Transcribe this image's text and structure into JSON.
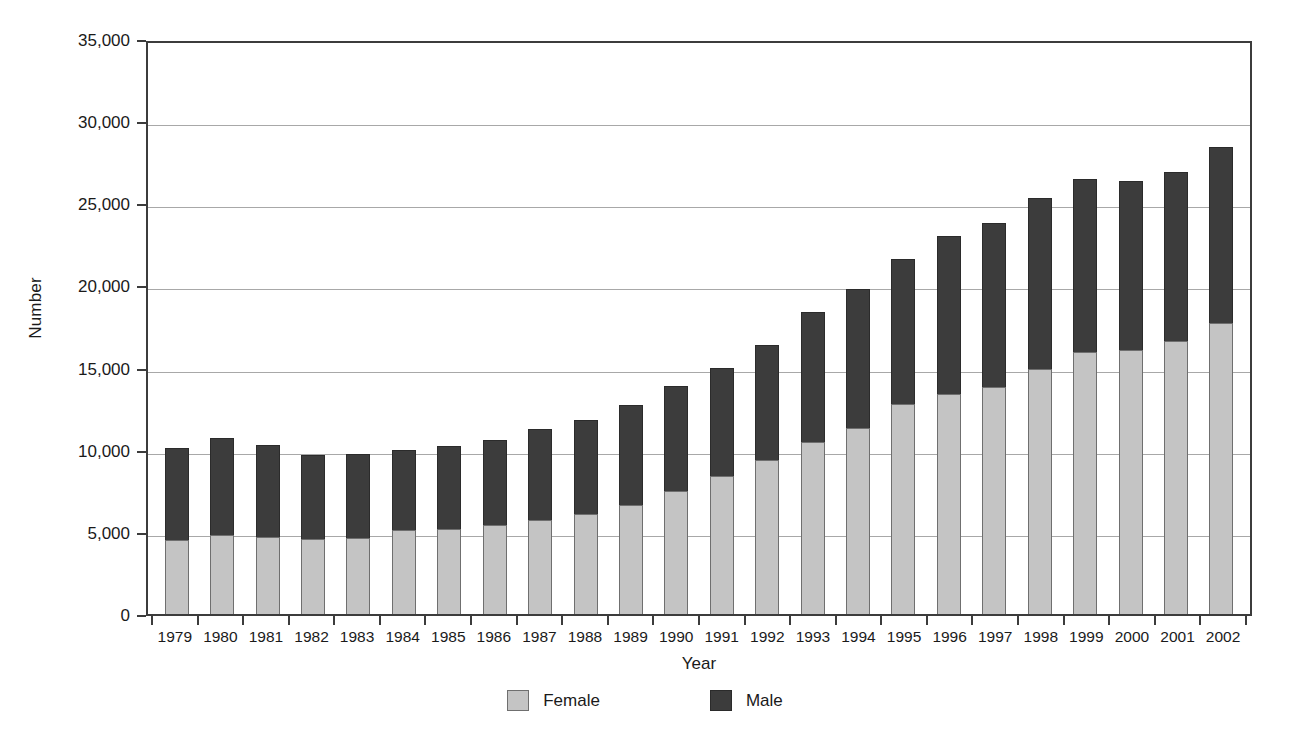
{
  "chart_data": {
    "type": "bar",
    "subtype": "stacked-vertical",
    "title": "",
    "xlabel": "Year",
    "ylabel": "Number",
    "ylim": [
      0,
      35000
    ],
    "ytick_step": 5000,
    "ytick_labels": [
      "0",
      "5,000",
      "10,000",
      "15,000",
      "20,000",
      "25,000",
      "30,000",
      "35,000"
    ],
    "ytick_values": [
      0,
      5000,
      10000,
      15000,
      20000,
      25000,
      30000,
      35000
    ],
    "grid": true,
    "grid_axis": "y",
    "legend_position": "bottom-center",
    "categories": [
      "1979",
      "1980",
      "1981",
      "1982",
      "1983",
      "1984",
      "1985",
      "1986",
      "1987",
      "1988",
      "1989",
      "1990",
      "1991",
      "1992",
      "1993",
      "1994",
      "1995",
      "1996",
      "1997",
      "1998",
      "1999",
      "2000",
      "2001",
      "2002"
    ],
    "series": [
      {
        "name": "Female",
        "color": "#c4c4c4",
        "values": [
          4500,
          4800,
          4700,
          4550,
          4650,
          5100,
          5200,
          5400,
          5700,
          6100,
          6650,
          7500,
          8400,
          9350,
          10500,
          11350,
          12800,
          13400,
          13800,
          14900,
          15950,
          16100,
          16600,
          17700
        ]
      },
      {
        "name": "Male",
        "color": "#3c3c3c",
        "values": [
          5600,
          5900,
          5600,
          5100,
          5100,
          4900,
          5000,
          5200,
          5550,
          5700,
          6050,
          6350,
          6600,
          7050,
          7900,
          8450,
          8800,
          9600,
          10000,
          10400,
          10550,
          10250,
          10300,
          10700
        ]
      }
    ],
    "totals": [
      10100,
      10700,
      10300,
      9650,
      9750,
      10000,
      10200,
      10600,
      11250,
      11800,
      12700,
      13850,
      15000,
      16400,
      18400,
      19800,
      21600,
      23000,
      23800,
      25300,
      26500,
      26350,
      26900,
      28400
    ]
  },
  "legend": {
    "items": [
      {
        "label": "Female",
        "swatch": "female-swatch"
      },
      {
        "label": "Male",
        "swatch": "male-swatch"
      }
    ]
  },
  "axes": {
    "y_title": "Number",
    "x_title": "Year"
  }
}
